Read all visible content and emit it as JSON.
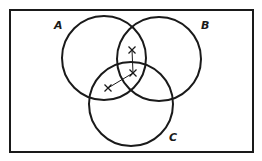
{
  "diagram": {
    "type": "venn",
    "universe": {
      "x": 10,
      "y": 10,
      "width": 243,
      "height": 142
    },
    "sets": [
      {
        "label": "A",
        "cx": 104,
        "cy": 58,
        "r": 42,
        "label_x": 54,
        "label_y": 29
      },
      {
        "label": "B",
        "cx": 159,
        "cy": 59,
        "r": 42,
        "label_x": 201,
        "label_y": 29
      },
      {
        "label": "C",
        "cx": 131,
        "cy": 104,
        "r": 42,
        "label_x": 169,
        "label_y": 141
      }
    ],
    "points": [
      {
        "x": 132,
        "y": 50,
        "mark": "X"
      },
      {
        "x": 133,
        "y": 73,
        "mark": "X"
      },
      {
        "x": 108,
        "y": 88,
        "mark": "X"
      }
    ],
    "links": [
      {
        "from": 0,
        "to": 1
      },
      {
        "from": 1,
        "to": 2
      }
    ],
    "colors": {
      "stroke": "#1a1a1a",
      "background": "#ffffff"
    }
  }
}
